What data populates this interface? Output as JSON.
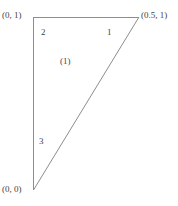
{
  "figure": {
    "type": "geometry-diagram",
    "shape": "triangle",
    "line_color": "#8d8d8d",
    "text_color": "#3f3f3f",
    "background": "#ffffff",
    "vertices": [
      {
        "id": "v-top-left",
        "label": "(0, 1)",
        "x": 0.0,
        "y": 1.0
      },
      {
        "id": "v-top-right",
        "label": "(0.5, 1)",
        "x": 0.5,
        "y": 1.0
      },
      {
        "id": "v-bottom",
        "label": "(0, 0)",
        "x": 0.0,
        "y": 0.0
      }
    ],
    "edges": [
      {
        "id": "edge-top",
        "label": "2",
        "from": "v-top-left",
        "to": "v-top-right"
      },
      {
        "id": "edge-diagonal",
        "label": "1",
        "from": "v-top-right",
        "to": "v-bottom"
      },
      {
        "id": "edge-left",
        "label": "3",
        "from": "v-bottom",
        "to": "v-top-left"
      }
    ],
    "regions": [
      {
        "id": "region-1",
        "label": "(1)"
      }
    ]
  }
}
